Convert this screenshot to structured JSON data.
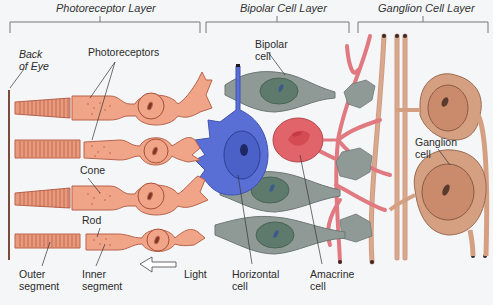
{
  "diagram": {
    "layers": [
      {
        "name": "Photoreceptor Layer"
      },
      {
        "name": "Bipolar Cell Layer"
      },
      {
        "name": "Ganglion Cell Layer"
      }
    ],
    "labels": {
      "back_of_eye": [
        "Back",
        "of Eye"
      ],
      "photoreceptors": "Photoreceptors",
      "cone": "Cone",
      "rod": "Rod",
      "outer_segment": [
        "Outer",
        "segment"
      ],
      "inner_segment": [
        "Inner",
        "segment"
      ],
      "light": "Light",
      "horizontal_cell": [
        "Horizontal",
        "cell"
      ],
      "amacrine_cell": [
        "Amacrine",
        "cell"
      ],
      "bipolar_cell": [
        "Bipolar",
        "cell"
      ],
      "ganglion_cell": [
        "Ganglion",
        "cell"
      ]
    },
    "colors": {
      "photoreceptor": "#f0a488",
      "photoreceptor_stroke": "#b8634c",
      "bipolar": "#8f9a96",
      "bipolar_nucleus": "#5d7a6c",
      "horizontal": "#5a6fd6",
      "amacrine": "#e0646a",
      "ganglion": "#d4a081",
      "ganglion_axon": "#c98b72",
      "background": "#f5f6f8"
    }
  }
}
